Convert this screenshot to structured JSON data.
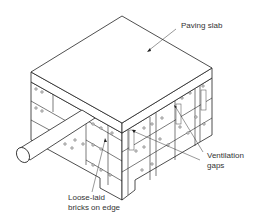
{
  "diagram": {
    "type": "isometric technical illustration",
    "labels": {
      "paving_slab": "Paving slab",
      "ventilation_gaps_line1": "Ventilation",
      "ventilation_gaps_line2": "gaps",
      "bricks_line1": "Loose-laid",
      "bricks_line2": "bricks on edge"
    },
    "colors": {
      "line": "#222222",
      "background": "#ffffff",
      "text": "#333333"
    }
  }
}
